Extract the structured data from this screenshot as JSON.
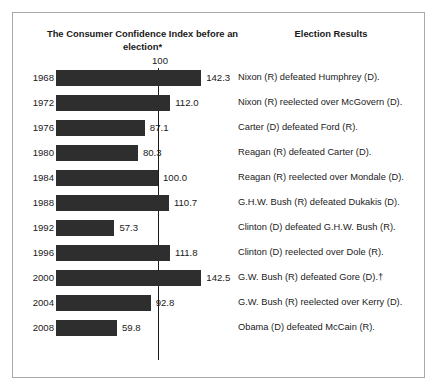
{
  "top_strip": {
    "clipped_caption": "elections"
  },
  "figure": {
    "headings": {
      "left": "The Consumer Confidence Index before an election*",
      "right": "Election Results"
    },
    "axis": {
      "reference_label": "100",
      "reference_value": 100
    },
    "colors": {
      "bar": "#2e2e2e",
      "frame": "#a9a9ad",
      "text": "#1a1a1a"
    }
  },
  "chart_data": {
    "type": "bar",
    "orientation": "horizontal",
    "title": "The Consumer Confidence Index before an election*",
    "xlabel": "",
    "ylabel": "",
    "xlim": [
      0,
      150
    ],
    "grid": false,
    "reference_line": 100,
    "reference_line_label": "100",
    "categories": [
      "1968",
      "1972",
      "1976",
      "1980",
      "1984",
      "1988",
      "1992",
      "1996",
      "2000",
      "2004",
      "2008"
    ],
    "values": [
      142.3,
      112.0,
      87.1,
      80.3,
      100.0,
      110.7,
      57.3,
      111.8,
      142.5,
      92.8,
      59.8
    ],
    "value_labels": [
      "142.3",
      "112.0",
      "87.1",
      "80.3",
      "100.0",
      "110.7",
      "57.3",
      "111.8",
      "142.5",
      "92.8",
      "59.8"
    ],
    "annotations": [
      "Nixon (R) defeated Humphrey (D).",
      "Nixon (R) reelected over McGovern (D).",
      "Carter (D) defeated Ford (R).",
      "Reagan (R) defeated Carter (D).",
      "Reagan (R) reelected over Mondale (D).",
      "G.H.W. Bush (R) defeated Dukakis (D).",
      "Clinton (D) defeated G.H.W. Bush (R).",
      "Clinton (D) reelected over Dole (R).",
      "G.W. Bush (R) defeated Gore (D).†",
      "G.W. Bush (R) reelected over Kerry (D).",
      "Obama (D) defeated McCain (R)."
    ]
  },
  "rows": [
    {
      "year": "1968",
      "value": "142.3",
      "result": "Nixon (R) defeated Humphrey (D)."
    },
    {
      "year": "1972",
      "value": "112.0",
      "result": "Nixon (R) reelected over McGovern (D)."
    },
    {
      "year": "1976",
      "value": "87.1",
      "result": "Carter (D) defeated Ford (R)."
    },
    {
      "year": "1980",
      "value": "80.3",
      "result": "Reagan (R) defeated Carter (D)."
    },
    {
      "year": "1984",
      "value": "100.0",
      "result": "Reagan (R) reelected over Mondale (D)."
    },
    {
      "year": "1988",
      "value": "110.7",
      "result": "G.H.W. Bush (R) defeated Dukakis (D)."
    },
    {
      "year": "1992",
      "value": "57.3",
      "result": "Clinton (D) defeated G.H.W. Bush (R)."
    },
    {
      "year": "1996",
      "value": "111.8",
      "result": "Clinton (D) reelected over Dole (R)."
    },
    {
      "year": "2000",
      "value": "142.5",
      "result": "G.W. Bush (R) defeated Gore (D).†"
    },
    {
      "year": "2004",
      "value": "92.8",
      "result": "G.W. Bush (R) reelected over Kerry (D)."
    },
    {
      "year": "2008",
      "value": "59.8",
      "result": "Obama (D) defeated McCain (R)."
    }
  ]
}
